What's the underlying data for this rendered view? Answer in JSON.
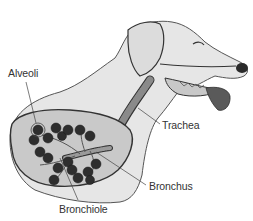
{
  "diagram": {
    "labels": {
      "alveoli": "Alveoli",
      "trachea": "Trachea",
      "bronchus": "Bronchus",
      "bronchiole": "Bronchiole"
    },
    "colors": {
      "body_fill": "#e6e6e6",
      "lung_fill": "#c9c9c9",
      "outline": "#333333",
      "alveoli_fill": "#2e2e2e",
      "tongue": "#5a5a5a",
      "trachea": "#7a7a7a",
      "background": "#ffffff"
    }
  }
}
